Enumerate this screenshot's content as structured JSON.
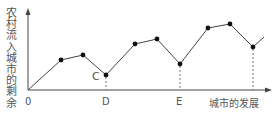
{
  "chart_data": {
    "type": "line",
    "title": "",
    "ylabel": "农村流入城市的剩余",
    "xlabel": "城市的发展",
    "origin_label": "0",
    "x_tick_labels": [
      "D",
      "E"
    ],
    "annotations": [
      "C"
    ],
    "grid": false,
    "legend": null,
    "series": [
      {
        "name": "农村流入城市的剩余",
        "points_px": [
          [
            28,
            90
          ],
          [
            61,
            60
          ],
          [
            83,
            55
          ],
          [
            106,
            75
          ],
          [
            135,
            44
          ],
          [
            157,
            39
          ],
          [
            180,
            64
          ],
          [
            208,
            28
          ],
          [
            230,
            24
          ],
          [
            253,
            47
          ],
          [
            264,
            37
          ]
        ],
        "markers": [
          [
            61,
            60
          ],
          [
            83,
            55
          ],
          [
            106,
            75
          ],
          [
            135,
            44
          ],
          [
            157,
            39
          ],
          [
            180,
            64
          ],
          [
            208,
            28
          ],
          [
            230,
            24
          ],
          [
            253,
            47
          ]
        ]
      }
    ],
    "dashed_drops": [
      [
        106,
        75
      ],
      [
        180,
        64
      ],
      [
        253,
        47
      ]
    ],
    "color": "#333333"
  },
  "labels": {
    "y": "农村流入城市的剩余",
    "x": "城市的发展",
    "origin": "0",
    "d": "D",
    "e": "E",
    "c": "C"
  }
}
